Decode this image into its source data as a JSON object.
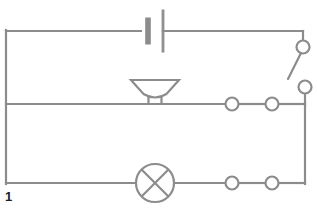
{
  "figure": {
    "label": "1",
    "width": 317,
    "height": 211,
    "background_color": "#ffffff",
    "wire_color": "#8c8c8c",
    "wire_width": 2.2,
    "label_color": "#1d1d1d"
  },
  "chart_data": {
    "type": "diagram",
    "subtitle": ""
  },
  "rails": {
    "left_x": 6,
    "right_x": 305,
    "top_y": 31,
    "middle_y": 104,
    "bottom_y": 183
  },
  "components": [
    {
      "id": "battery",
      "name": "battery-symbol",
      "label": "Battery",
      "rail": "top",
      "x": 155,
      "y": 31,
      "negative_plate_x": 148,
      "positive_plate_x": 163,
      "short_plate_half_height": 13,
      "long_plate_half_height": 21,
      "short_plate_thickness": 4.5,
      "long_plate_thickness": 1.8
    },
    {
      "id": "bell",
      "name": "bell-symbol",
      "label": "Bell / buzzer",
      "rail": "middle",
      "x": 155,
      "y": 104,
      "top_width": 48,
      "bottom_width": 17,
      "height": 17,
      "stem_width": 13,
      "stem_height": 7
    },
    {
      "id": "lamp",
      "name": "lamp-symbol",
      "label": "Lamp",
      "rail": "bottom",
      "cx": 155,
      "cy": 183,
      "r": 19
    },
    {
      "id": "switch",
      "name": "switch-symbol",
      "label": "Switch (open)",
      "state": "open",
      "top_terminal_cx": 303,
      "top_terminal_cy": 47,
      "bottom_terminal_cx": 305,
      "bottom_terminal_cy": 87,
      "terminal_r": 6.5,
      "lever_start_x": 301,
      "lever_start_y": 53,
      "lever_end_x": 288,
      "lever_end_y": 79
    }
  ],
  "connectors": [
    {
      "id": "connector-middle-left",
      "name": "terminal-node",
      "rail": "middle",
      "cx": 232,
      "cy": 104,
      "r": 6.5
    },
    {
      "id": "connector-middle-right",
      "name": "terminal-node",
      "rail": "middle",
      "cx": 272,
      "cy": 104,
      "r": 6.5
    },
    {
      "id": "connector-bottom-left",
      "name": "terminal-node",
      "rail": "bottom",
      "cx": 232,
      "cy": 183,
      "r": 6.5
    },
    {
      "id": "connector-bottom-right",
      "name": "terminal-node",
      "rail": "bottom",
      "cx": 272,
      "cy": 183,
      "r": 6.5
    }
  ]
}
